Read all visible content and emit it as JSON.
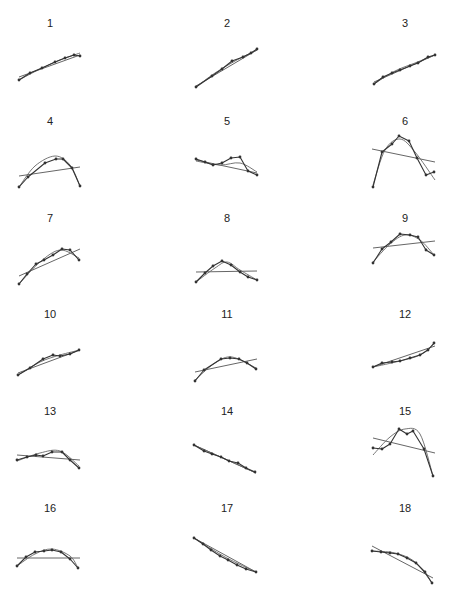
{
  "figure": {
    "panels": [
      {
        "label": "1",
        "cx": 50,
        "ly": 27,
        "pts": [
          [
            19,
            80
          ],
          [
            30,
            73
          ],
          [
            42,
            68
          ],
          [
            55,
            62
          ],
          [
            65,
            58
          ],
          [
            74,
            55
          ],
          [
            80,
            56
          ]
        ],
        "lin": [
          [
            19,
            77
          ],
          [
            80,
            55
          ]
        ],
        "curve": [
          [
            19,
            80
          ],
          [
            40,
            69
          ],
          [
            60,
            60
          ],
          [
            80,
            53
          ]
        ]
      },
      {
        "label": "2",
        "cx": 227,
        "ly": 27,
        "pts": [
          [
            196,
            87
          ],
          [
            212,
            76
          ],
          [
            222,
            69
          ],
          [
            232,
            61
          ],
          [
            243,
            57
          ],
          [
            251,
            53
          ],
          [
            257,
            49
          ]
        ],
        "lin": [
          [
            196,
            86
          ],
          [
            257,
            50
          ]
        ],
        "curve": [
          [
            196,
            87
          ],
          [
            215,
            73
          ],
          [
            235,
            61
          ],
          [
            257,
            50
          ]
        ]
      },
      {
        "label": "3",
        "cx": 405,
        "ly": 27,
        "pts": [
          [
            374,
            84
          ],
          [
            383,
            77
          ],
          [
            392,
            73
          ],
          [
            400,
            70
          ],
          [
            410,
            66
          ],
          [
            418,
            63
          ],
          [
            428,
            57
          ],
          [
            435,
            55
          ]
        ],
        "lin": [
          [
            374,
            82
          ],
          [
            435,
            55
          ]
        ],
        "curve": [
          [
            374,
            84
          ],
          [
            395,
            71
          ],
          [
            415,
            63
          ],
          [
            435,
            55
          ]
        ]
      },
      {
        "label": "4",
        "cx": 50,
        "ly": 125,
        "pts": [
          [
            19,
            187
          ],
          [
            28,
            177
          ],
          [
            45,
            163
          ],
          [
            56,
            159
          ],
          [
            63,
            159
          ],
          [
            72,
            168
          ],
          [
            80,
            186
          ]
        ],
        "lin": [
          [
            19,
            176
          ],
          [
            80,
            167
          ]
        ],
        "curve": [
          [
            19,
            187
          ],
          [
            35,
            166
          ],
          [
            55,
            156
          ],
          [
            70,
            165
          ],
          [
            80,
            186
          ]
        ]
      },
      {
        "label": "5",
        "cx": 227,
        "ly": 125,
        "pts": [
          [
            196,
            159
          ],
          [
            205,
            162
          ],
          [
            213,
            165
          ],
          [
            222,
            163
          ],
          [
            231,
            158
          ],
          [
            240,
            157
          ],
          [
            248,
            171
          ],
          [
            257,
            175
          ]
        ],
        "lin": [
          [
            196,
            160
          ],
          [
            257,
            173
          ]
        ],
        "curve": [
          [
            196,
            161
          ],
          [
            220,
            165
          ],
          [
            240,
            163
          ],
          [
            257,
            172
          ]
        ]
      },
      {
        "label": "6",
        "cx": 405,
        "ly": 125,
        "pts": [
          [
            373,
            187
          ],
          [
            382,
            152
          ],
          [
            392,
            144
          ],
          [
            399,
            136
          ],
          [
            409,
            141
          ],
          [
            417,
            158
          ],
          [
            426,
            175
          ],
          [
            434,
            172
          ]
        ],
        "lin": [
          [
            372,
            149
          ],
          [
            435,
            162
          ]
        ],
        "curve": [
          [
            373,
            185
          ],
          [
            385,
            150
          ],
          [
            400,
            139
          ],
          [
            415,
            152
          ],
          [
            435,
            180
          ]
        ]
      },
      {
        "label": "7",
        "cx": 50,
        "ly": 222,
        "pts": [
          [
            19,
            284
          ],
          [
            27,
            274
          ],
          [
            36,
            264
          ],
          [
            44,
            260
          ],
          [
            53,
            255
          ],
          [
            62,
            249
          ],
          [
            70,
            250
          ],
          [
            79,
            260
          ]
        ],
        "lin": [
          [
            19,
            276
          ],
          [
            80,
            249
          ]
        ],
        "curve": [
          [
            19,
            284
          ],
          [
            40,
            262
          ],
          [
            60,
            250
          ],
          [
            79,
            258
          ]
        ]
      },
      {
        "label": "8",
        "cx": 227,
        "ly": 222,
        "pts": [
          [
            196,
            282
          ],
          [
            205,
            273
          ],
          [
            213,
            266
          ],
          [
            222,
            261
          ],
          [
            231,
            265
          ],
          [
            240,
            272
          ],
          [
            248,
            277
          ],
          [
            257,
            280
          ]
        ],
        "lin": [
          [
            196,
            272
          ],
          [
            257,
            271
          ]
        ],
        "curve": [
          [
            196,
            282
          ],
          [
            215,
            268
          ],
          [
            227,
            262
          ],
          [
            240,
            270
          ],
          [
            257,
            280
          ]
        ]
      },
      {
        "label": "9",
        "cx": 405,
        "ly": 222,
        "pts": [
          [
            373,
            263
          ],
          [
            382,
            249
          ],
          [
            391,
            242
          ],
          [
            400,
            234
          ],
          [
            410,
            235
          ],
          [
            418,
            237
          ],
          [
            426,
            250
          ],
          [
            434,
            255
          ]
        ],
        "lin": [
          [
            373,
            248
          ],
          [
            435,
            241
          ]
        ],
        "curve": [
          [
            373,
            262
          ],
          [
            390,
            244
          ],
          [
            405,
            235
          ],
          [
            420,
            240
          ],
          [
            434,
            255
          ]
        ]
      },
      {
        "label": "10",
        "cx": 50,
        "ly": 318,
        "pts": [
          [
            18,
            375
          ],
          [
            30,
            368
          ],
          [
            43,
            359
          ],
          [
            53,
            355
          ],
          [
            60,
            356
          ],
          [
            70,
            354
          ],
          [
            79,
            350
          ]
        ],
        "lin": [
          [
            18,
            373
          ],
          [
            80,
            350
          ]
        ],
        "curve": [
          [
            18,
            375
          ],
          [
            40,
            362
          ],
          [
            60,
            355
          ],
          [
            80,
            350
          ]
        ]
      },
      {
        "label": "11",
        "cx": 227,
        "ly": 318,
        "pts": [
          [
            195,
            381
          ],
          [
            204,
            370
          ],
          [
            221,
            359
          ],
          [
            230,
            358
          ],
          [
            239,
            359
          ],
          [
            247,
            363
          ],
          [
            256,
            369
          ]
        ],
        "lin": [
          [
            195,
            372
          ],
          [
            257,
            359
          ]
        ],
        "curve": [
          [
            195,
            380
          ],
          [
            215,
            363
          ],
          [
            232,
            357
          ],
          [
            256,
            368
          ]
        ]
      },
      {
        "label": "12",
        "cx": 405,
        "ly": 318,
        "pts": [
          [
            373,
            367
          ],
          [
            382,
            363
          ],
          [
            392,
            362
          ],
          [
            400,
            361
          ],
          [
            410,
            358
          ],
          [
            420,
            355
          ],
          [
            428,
            350
          ],
          [
            434,
            343
          ]
        ],
        "lin": [
          [
            373,
            367
          ],
          [
            435,
            346
          ]
        ],
        "curve": [
          [
            373,
            367
          ],
          [
            400,
            361
          ],
          [
            420,
            355
          ],
          [
            434,
            344
          ]
        ]
      },
      {
        "label": "13",
        "cx": 50,
        "ly": 415,
        "pts": [
          [
            17,
            460
          ],
          [
            27,
            457
          ],
          [
            36,
            455
          ],
          [
            43,
            456
          ],
          [
            52,
            452
          ],
          [
            62,
            452
          ],
          [
            70,
            460
          ],
          [
            79,
            468
          ]
        ],
        "lin": [
          [
            17,
            455
          ],
          [
            80,
            460
          ]
        ],
        "curve": [
          [
            17,
            461
          ],
          [
            40,
            453
          ],
          [
            60,
            451
          ],
          [
            79,
            466
          ]
        ]
      },
      {
        "label": "14",
        "cx": 227,
        "ly": 415,
        "pts": [
          [
            194,
            445
          ],
          [
            204,
            451
          ],
          [
            212,
            454
          ],
          [
            221,
            457
          ],
          [
            229,
            461
          ],
          [
            238,
            463
          ],
          [
            246,
            468
          ],
          [
            255,
            472
          ]
        ],
        "lin": [
          [
            194,
            445
          ],
          [
            256,
            473
          ]
        ],
        "curve": [
          [
            194,
            445
          ],
          [
            225,
            459
          ],
          [
            256,
            473
          ]
        ]
      },
      {
        "label": "15",
        "cx": 405,
        "ly": 415,
        "pts": [
          [
            373,
            448
          ],
          [
            382,
            449
          ],
          [
            390,
            444
          ],
          [
            399,
            429
          ],
          [
            407,
            434
          ],
          [
            413,
            431
          ],
          [
            424,
            449
          ],
          [
            433,
            476
          ]
        ],
        "lin": [
          [
            373,
            438
          ],
          [
            435,
            453
          ]
        ],
        "curve": [
          [
            373,
            455
          ],
          [
            390,
            437
          ],
          [
            405,
            429
          ],
          [
            420,
            434
          ],
          [
            433,
            476
          ]
        ]
      },
      {
        "label": "16",
        "cx": 50,
        "ly": 512,
        "pts": [
          [
            17,
            566
          ],
          [
            26,
            557
          ],
          [
            35,
            552
          ],
          [
            44,
            551
          ],
          [
            52,
            550
          ],
          [
            61,
            552
          ],
          [
            70,
            559
          ],
          [
            78,
            568
          ]
        ],
        "lin": [
          [
            17,
            558
          ],
          [
            80,
            558
          ]
        ],
        "curve": [
          [
            17,
            566
          ],
          [
            35,
            554
          ],
          [
            52,
            549
          ],
          [
            70,
            556
          ],
          [
            78,
            568
          ]
        ]
      },
      {
        "label": "17",
        "cx": 227,
        "ly": 512,
        "pts": [
          [
            194,
            538
          ],
          [
            203,
            544
          ],
          [
            211,
            550
          ],
          [
            220,
            556
          ],
          [
            228,
            560
          ],
          [
            237,
            565
          ],
          [
            246,
            569
          ],
          [
            256,
            572
          ]
        ],
        "lin": [
          [
            194,
            538
          ],
          [
            256,
            572
          ]
        ],
        "curve": [
          [
            194,
            538
          ],
          [
            225,
            557
          ],
          [
            256,
            572
          ]
        ]
      },
      {
        "label": "18",
        "cx": 405,
        "ly": 512,
        "pts": [
          [
            372,
            551
          ],
          [
            381,
            552
          ],
          [
            390,
            553
          ],
          [
            398,
            554
          ],
          [
            407,
            558
          ],
          [
            416,
            563
          ],
          [
            425,
            572
          ],
          [
            432,
            583
          ]
        ],
        "lin": [
          [
            372,
            546
          ],
          [
            433,
            578
          ]
        ],
        "curve": [
          [
            372,
            551
          ],
          [
            395,
            553
          ],
          [
            415,
            562
          ],
          [
            432,
            583
          ]
        ]
      }
    ]
  },
  "chart_data": {
    "type": "line",
    "title": "",
    "layout": {
      "rows": 6,
      "cols": 3,
      "grid": false,
      "axes": false
    },
    "panel_labels": [
      "1",
      "2",
      "3",
      "4",
      "5",
      "6",
      "7",
      "8",
      "9",
      "10",
      "11",
      "12",
      "13",
      "14",
      "15",
      "16",
      "17",
      "18"
    ],
    "series_per_panel": [
      "observed points (polyline with markers)",
      "linear fit",
      "curved (quadratic) fit"
    ],
    "panels": [
      {
        "label": "1",
        "shape": "increasing, slightly concave"
      },
      {
        "label": "2",
        "shape": "increasing, nearly linear"
      },
      {
        "label": "3",
        "shape": "increasing, nearly linear"
      },
      {
        "label": "4",
        "shape": "inverted U, peak right of center"
      },
      {
        "label": "5",
        "shape": "flat to slightly decreasing, bump near end"
      },
      {
        "label": "6",
        "shape": "strong inverted U"
      },
      {
        "label": "7",
        "shape": "increasing, concave"
      },
      {
        "label": "8",
        "shape": "inverted U, peak at center"
      },
      {
        "label": "9",
        "shape": "inverted U, peak left of center"
      },
      {
        "label": "10",
        "shape": "increasing, concave"
      },
      {
        "label": "11",
        "shape": "inverted U, peak right of center"
      },
      {
        "label": "12",
        "shape": "increasing, slightly convex"
      },
      {
        "label": "13",
        "shape": "flat then dropping at end"
      },
      {
        "label": "14",
        "shape": "decreasing, linear"
      },
      {
        "label": "15",
        "shape": "irregular inverted U with steep end drop"
      },
      {
        "label": "16",
        "shape": "inverted U, symmetric"
      },
      {
        "label": "17",
        "shape": "decreasing, linear"
      },
      {
        "label": "18",
        "shape": "flat then decreasing, concave"
      }
    ]
  }
}
